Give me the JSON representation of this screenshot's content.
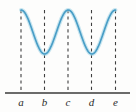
{
  "figure": {
    "background_color": "#fdfdfc",
    "width": 136,
    "height": 112
  },
  "colors": {
    "curve": "#4a9ec6",
    "curve_highlight": "#9fd3e6",
    "axis": "#3a3a3a",
    "dashed_line": "#3f3f3f",
    "label": "#2b2b2b"
  },
  "axis": {
    "name": "horizontal-axis",
    "x_start": 5,
    "x_end": 130,
    "y": 93,
    "stroke_width": 1.3
  },
  "dashed_lines": [
    {
      "label": "a",
      "x": 21,
      "y_top": 10,
      "y_bottom": 93
    },
    {
      "label": "b",
      "x": 44.5,
      "y_top": 10,
      "y_bottom": 93
    },
    {
      "label": "c",
      "x": 68,
      "y_top": 10,
      "y_bottom": 93
    },
    {
      "label": "d",
      "x": 91.5,
      "y_top": 10,
      "y_bottom": 93
    },
    {
      "label": "e",
      "x": 115.5,
      "y_top": 10,
      "y_bottom": 93
    }
  ],
  "tick_labels": [
    {
      "text": "a",
      "x": 21,
      "y": 106
    },
    {
      "text": "b",
      "x": 44.5,
      "y": 106
    },
    {
      "text": "c",
      "x": 68,
      "y": 106
    },
    {
      "text": "d",
      "x": 91.5,
      "y": 106
    },
    {
      "text": "e",
      "x": 115.5,
      "y": 106
    }
  ],
  "chart_data": {
    "type": "line",
    "title": "",
    "xlabel": "",
    "ylabel": "",
    "grid": false,
    "legend": null,
    "xlim": [
      21,
      115.5
    ],
    "ylim_pixels": [
      10,
      54
    ],
    "curve_color": "#4a9ec6",
    "x_tick_labels": [
      "a",
      "b",
      "c",
      "d",
      "e"
    ],
    "x_tick_positions": [
      21,
      44.5,
      68,
      91.5,
      115.5
    ],
    "extrema": [
      {
        "label": "a",
        "x": 21,
        "y_pixel": 10,
        "kind": "maximum"
      },
      {
        "label": "b",
        "x": 44.5,
        "y_pixel": 54,
        "kind": "minimum"
      },
      {
        "label": "c",
        "x": 68,
        "y_pixel": 10,
        "kind": "maximum"
      },
      {
        "label": "d",
        "x": 91.5,
        "y_pixel": 54,
        "kind": "minimum"
      },
      {
        "label": "e",
        "x": 115.5,
        "y_pixel": 10,
        "kind": "maximum"
      }
    ],
    "path_d": "M 21,10 C 26.9,10 29.8,13.3 32.75,21.0 C 35.7,28.8 38.6,54 44.5,54 C 50.4,54 53.3,28.8 56.25,21.0 C 59.2,13.3 62.1,10 68,10 C 73.9,10 76.8,13.3 79.75,21.0 C 82.7,28.8 85.6,54 91.5,54 C 97.4,54 100.3,28.8 103.25,21.0 C 106.2,13.3 109.6,10 115.5,10"
  }
}
